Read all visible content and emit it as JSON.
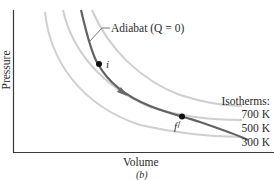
{
  "figure": {
    "sublabel": "(b)",
    "axes": {
      "xlabel": "Volume",
      "ylabel": "Pressure",
      "color": "#3a3a3a"
    },
    "adiabat": {
      "label": "Adiabat (Q = 0)",
      "color": "#5f5f5f",
      "direction": "from i toward f (expansion)"
    },
    "points": [
      {
        "name": "initial",
        "label": "i"
      },
      {
        "name": "final",
        "label": "f"
      }
    ],
    "isotherms": {
      "title": "Isotherms:",
      "color": "#c8c8c8",
      "items": [
        {
          "label": "700 K"
        },
        {
          "label": "500 K"
        },
        {
          "label": "300 K"
        }
      ]
    }
  }
}
